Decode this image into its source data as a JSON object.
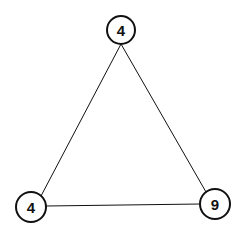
{
  "diagram": {
    "type": "graph",
    "nodes": [
      {
        "id": "top",
        "label": "4",
        "cx": 121,
        "cy": 30,
        "r": 14
      },
      {
        "id": "bottom-left",
        "label": "4",
        "cx": 31,
        "cy": 207,
        "r": 15
      },
      {
        "id": "bottom-right",
        "label": "9",
        "cx": 215,
        "cy": 204,
        "r": 15
      }
    ],
    "edges": [
      {
        "from": "top",
        "to": "bottom-left"
      },
      {
        "from": "top",
        "to": "bottom-right"
      },
      {
        "from": "bottom-left",
        "to": "bottom-right"
      }
    ],
    "colors": {
      "stroke": "#111111",
      "background": "#ffffff"
    }
  }
}
